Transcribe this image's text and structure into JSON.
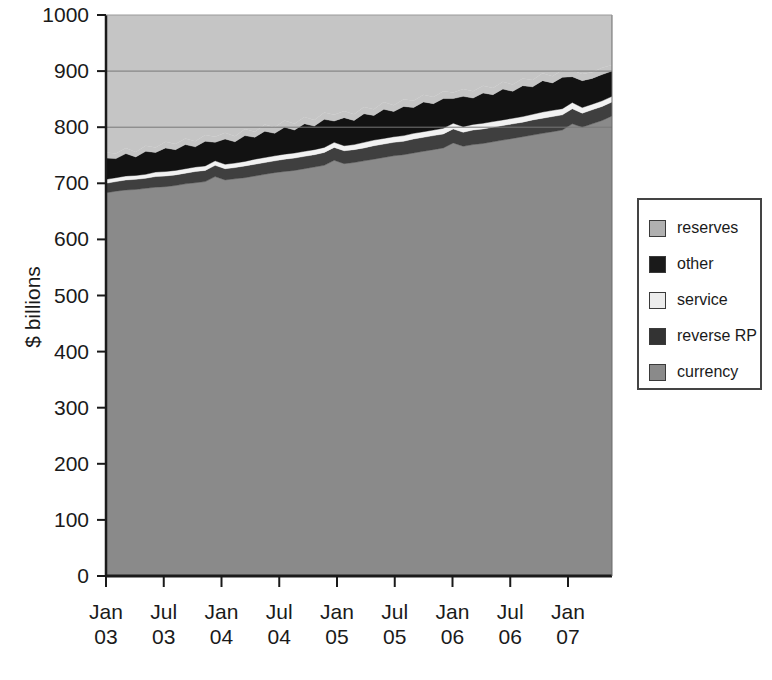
{
  "chart_data": {
    "type": "area",
    "stacked": true,
    "title": "",
    "subtitle": "",
    "xlabel": "",
    "ylabel": "$ billions",
    "ylim": [
      0,
      1000
    ],
    "ytick_values": [
      0,
      100,
      200,
      300,
      400,
      500,
      600,
      700,
      800,
      900,
      1000
    ],
    "ytick_labels": [
      "0",
      "100",
      "200",
      "300",
      "400",
      "500",
      "600",
      "700",
      "800",
      "900",
      "1000"
    ],
    "xtick_labels": [
      {
        "line1": "Jan",
        "line2": "03"
      },
      {
        "line1": "Jul",
        "line2": "03"
      },
      {
        "line1": "Jan",
        "line2": "04"
      },
      {
        "line1": "Jul",
        "line2": "04"
      },
      {
        "line1": "Jan",
        "line2": "05"
      },
      {
        "line1": "Jul",
        "line2": "05"
      },
      {
        "line1": "Jan",
        "line2": "06"
      },
      {
        "line1": "Jul",
        "line2": "06"
      },
      {
        "line1": "Jan",
        "line2": "07"
      }
    ],
    "grid": "horizontal-above-data-only",
    "gridlines_at": [
      800,
      900
    ],
    "legend_position": "right-outside",
    "x_start": "Jan 03",
    "x_end": "Apr 07",
    "x_points": 52,
    "series": [
      {
        "name": "currency",
        "color": "#8a8a8a",
        "order": 1,
        "values": [
          683,
          686,
          688,
          689,
          691,
          693,
          694,
          696,
          699,
          701,
          703,
          712,
          706,
          708,
          710,
          713,
          716,
          719,
          721,
          723,
          726,
          729,
          732,
          741,
          735,
          737,
          740,
          743,
          746,
          749,
          751,
          754,
          757,
          760,
          763,
          772,
          766,
          769,
          771,
          774,
          777,
          780,
          783,
          786,
          789,
          792,
          795,
          806,
          800,
          806,
          812,
          820
        ]
      },
      {
        "name": "reverse RP",
        "color": "#3f3f3f",
        "order": 2,
        "values": [
          17,
          17,
          18,
          18,
          18,
          19,
          19,
          19,
          19,
          20,
          20,
          20,
          20,
          20,
          21,
          21,
          21,
          21,
          22,
          22,
          22,
          22,
          23,
          23,
          23,
          23,
          23,
          24,
          24,
          24,
          24,
          25,
          25,
          25,
          25,
          25,
          25,
          26,
          26,
          26,
          26,
          26,
          26,
          27,
          27,
          27,
          27,
          27,
          25,
          25,
          25,
          25
        ]
      },
      {
        "name": "service",
        "color": "#f2f2f2",
        "order": 3,
        "values": [
          7,
          7,
          7,
          7,
          7,
          8,
          8,
          8,
          8,
          8,
          8,
          8,
          8,
          8,
          8,
          9,
          9,
          9,
          9,
          9,
          9,
          9,
          9,
          9,
          9,
          9,
          10,
          10,
          10,
          10,
          10,
          10,
          10,
          10,
          10,
          10,
          10,
          10,
          10,
          10,
          10,
          10,
          10,
          10,
          11,
          11,
          11,
          11,
          10,
          10,
          10,
          10
        ]
      },
      {
        "name": "other",
        "color": "#121212",
        "order": 4,
        "values": [
          38,
          34,
          40,
          33,
          41,
          35,
          42,
          37,
          43,
          36,
          44,
          33,
          45,
          38,
          46,
          39,
          47,
          40,
          48,
          41,
          49,
          42,
          50,
          38,
          50,
          43,
          51,
          44,
          52,
          45,
          52,
          46,
          53,
          47,
          53,
          44,
          54,
          47,
          54,
          48,
          55,
          48,
          55,
          49,
          56,
          49,
          56,
          46,
          48,
          46,
          47,
          45
        ]
      },
      {
        "name": "reserves",
        "color": "#c5c5c5",
        "order": 5,
        "values": [
          10,
          9,
          10,
          9,
          10,
          9,
          11,
          10,
          11,
          10,
          11,
          10,
          11,
          10,
          12,
          10,
          12,
          11,
          12,
          11,
          12,
          11,
          12,
          11,
          12,
          11,
          12,
          11,
          13,
          11,
          13,
          12,
          13,
          12,
          13,
          11,
          13,
          12,
          13,
          12,
          13,
          12,
          13,
          12,
          13,
          12,
          13,
          11,
          12,
          11,
          12,
          11
        ]
      }
    ],
    "colors": {
      "reserves": "#c5c5c5",
      "other": "#121212",
      "service": "#f2f2f2",
      "reverse_RP": "#3f3f3f",
      "currency": "#8a8a8a",
      "axis": "#1a1a1a",
      "gridline": "#777777",
      "plot_background": "#c5c5c5"
    }
  },
  "legend": {
    "items": [
      {
        "label": "reserves",
        "color": "#b0b0b0"
      },
      {
        "label": "other",
        "color": "#1a1a1a"
      },
      {
        "label": "service",
        "color": "#ececec"
      },
      {
        "label": "reverse RP",
        "color": "#333333"
      },
      {
        "label": "currency",
        "color": "#8a8a8a"
      }
    ]
  },
  "axes": {
    "y_title": "$ billions"
  }
}
